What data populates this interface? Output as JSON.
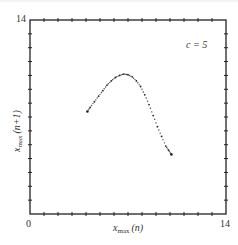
{
  "chart_data": {
    "type": "scatter",
    "title": "",
    "annotation": "c = 5",
    "xlabel": "x_max(n)",
    "ylabel": "x_max(n+1)",
    "xlim": [
      0,
      14
    ],
    "ylim": [
      0,
      14
    ],
    "x_tick_labels": [
      "0",
      "14"
    ],
    "y_tick_labels": [
      "14"
    ],
    "tick_interval": 1,
    "grid": false,
    "legend": null,
    "series": [
      {
        "name": "return map (c = 5)",
        "points": [
          [
            4.1,
            7.4
          ],
          [
            4.3,
            7.7
          ],
          [
            4.6,
            8.1
          ],
          [
            4.9,
            8.5
          ],
          [
            5.2,
            8.9
          ],
          [
            5.5,
            9.3
          ],
          [
            5.8,
            9.6
          ],
          [
            6.1,
            9.85
          ],
          [
            6.4,
            10.0
          ],
          [
            6.7,
            10.1
          ],
          [
            7.0,
            10.05
          ],
          [
            7.3,
            9.9
          ],
          [
            7.6,
            9.6
          ],
          [
            7.9,
            9.2
          ],
          [
            8.2,
            8.6
          ],
          [
            8.5,
            7.9
          ],
          [
            8.8,
            7.1
          ],
          [
            9.1,
            6.3
          ],
          [
            9.4,
            5.6
          ],
          [
            9.7,
            4.9
          ],
          [
            9.9,
            4.6
          ],
          [
            10.1,
            4.3
          ]
        ]
      }
    ]
  },
  "labels": {
    "x_zero": "0",
    "x_max": "14",
    "y_max": "14",
    "annotation": "c = 5",
    "xlabel_main": "x",
    "xlabel_sub": "max",
    "xlabel_arg": "(n)",
    "ylabel_main": "x",
    "ylabel_sub": "max",
    "ylabel_arg": "(n+1)"
  }
}
